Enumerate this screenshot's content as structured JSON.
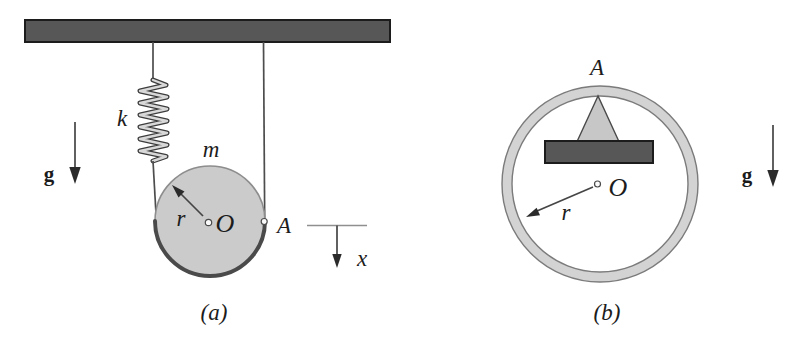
{
  "figure_a": {
    "caption": "(a)",
    "labels": {
      "spring_constant": "k",
      "mass": "m",
      "gravity": "g",
      "radius": "r",
      "center": "O",
      "point_a": "A",
      "coordinate": "x"
    }
  },
  "figure_b": {
    "caption": "(b)",
    "labels": {
      "gravity": "g",
      "radius": "r",
      "center": "O",
      "point_a": "A"
    }
  },
  "colors": {
    "dark_bar": "#575757",
    "outline_dark": "#1c1c1c",
    "disk_fill": "#cbcbcb",
    "ring_fill": "#d3d3d3",
    "line_gray": "#555555",
    "text_color": "#1c1c1c",
    "bg": "#ffffff"
  }
}
